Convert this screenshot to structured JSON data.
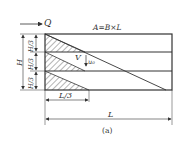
{
  "diagram": {
    "flow_label": "Q",
    "area_formula": "A=B×L",
    "height_label": "H",
    "layer_labels": [
      "H/3",
      "H/3",
      "H/3"
    ],
    "velocity_label": "V",
    "settling_label": "u₀",
    "third_length_label": "L/3",
    "length_label": "L",
    "caption": "(a)",
    "colors": {
      "line": "#333333",
      "background": "#ffffff"
    }
  }
}
